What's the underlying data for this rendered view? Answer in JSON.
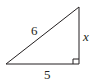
{
  "diagram": {
    "type": "right-triangle",
    "stroke_color": "#231f20",
    "vertices": {
      "bottom_left": [
        6,
        64
      ],
      "bottom_right": [
        79,
        64
      ],
      "top_right": [
        79,
        7
      ]
    },
    "labels": {
      "hypotenuse": "6",
      "vertical_leg": "x",
      "horizontal_leg": "5"
    },
    "right_angle_at": "bottom_right"
  }
}
